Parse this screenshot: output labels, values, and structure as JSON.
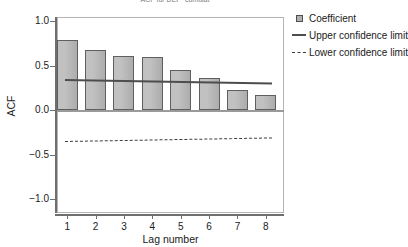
{
  "chart_data": {
    "type": "bar",
    "title": "ACF for DEP_cumulat",
    "xlabel": "Lag number",
    "ylabel": "ACF",
    "categories": [
      "1",
      "2",
      "3",
      "4",
      "5",
      "6",
      "7",
      "8"
    ],
    "values": [
      0.79,
      0.67,
      0.61,
      0.6,
      0.45,
      0.36,
      0.22,
      0.17
    ],
    "series": [
      {
        "name": "Coefficient",
        "type": "bar",
        "values": [
          0.79,
          0.67,
          0.61,
          0.6,
          0.45,
          0.36,
          0.22,
          0.17
        ]
      },
      {
        "name": "Upper confidence limit",
        "type": "line",
        "style": "solid",
        "values": [
          0.35,
          0.345,
          0.34,
          0.335,
          0.33,
          0.322,
          0.315,
          0.31
        ]
      },
      {
        "name": "Lower confidence limit",
        "type": "line",
        "style": "dashed",
        "values": [
          -0.35,
          -0.345,
          -0.34,
          -0.335,
          -0.33,
          -0.322,
          -0.315,
          -0.31
        ]
      }
    ],
    "ylim": [
      -1.25,
      1.25
    ],
    "yticks": [
      "1.0",
      "0.5",
      "0.0",
      "-0.5",
      "-1.0"
    ],
    "ytick_values": [
      1.0,
      0.5,
      0.0,
      -0.5,
      -1.0
    ],
    "xticks": [
      "1",
      "2",
      "3",
      "4",
      "5",
      "6",
      "7",
      "8"
    ],
    "grid": false,
    "legend_position": "right",
    "legend": [
      {
        "label": "Coefficient",
        "key": "square-swatch",
        "color": "#b0b0b0"
      },
      {
        "label": "Upper confidence limit",
        "key": "solid-line",
        "color": "#4d4d4d"
      },
      {
        "label": "Lower confidence limit",
        "key": "dashed-line",
        "color": "#3c3c3c"
      }
    ],
    "colors": {
      "bar_fill": "#b0b0b0",
      "bar_border": "#5f5f5f",
      "upper_limit": "#4d4d4d",
      "lower_limit": "#3c3c3c",
      "axis": "#6e6e6e",
      "frame": "#b4b4b4",
      "background": "#ffffff"
    }
  }
}
